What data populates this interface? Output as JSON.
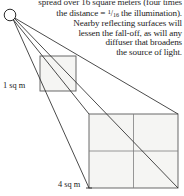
{
  "figure": {
    "kind": "inverse-square-law-diagram",
    "caption_lines": [
      "spread over 16 square meters (four times",
      "the distance = ¹/₁₆ the illumination).",
      "Nearby reflecting surfaces will",
      "lessen the fall-off, as will any",
      "diffuser that  broadens",
      "the source of light."
    ],
    "line_top_clipped": "spread over 16 square meters (four times",
    "line_distance_prefix": "the distance = ",
    "fraction_numerator": "1",
    "fraction_denominator": "16",
    "line_distance_suffix": " the illumination).",
    "line_nearby": "Nearby reflecting surfaces will",
    "line_lessen": "lessen the fall-off, as will any",
    "line_diffuser": "diffuser that  broadens",
    "line_source": "the source of light."
  },
  "labels": {
    "small_square": "1 sq m",
    "large_square": "4 sq m"
  },
  "colors": {
    "ink": "#1a1a1a",
    "ray": "#2b2b2b",
    "square_stroke": "#555555",
    "square_fill": "#f4f4f2",
    "grid_line": "#777777",
    "background": "#ffffff"
  },
  "geometry": {
    "light_source": {
      "cx": 10,
      "cy": 15,
      "r": 6
    },
    "small_square": {
      "x": 40,
      "y": 56,
      "w": 36,
      "h": 35,
      "grid": "none",
      "area_sq_m": 1
    },
    "large_square": {
      "x": 89,
      "y": 114,
      "w": 89,
      "h": 74,
      "grid": "2x2",
      "area_sq_m": 4
    },
    "rays_count": 4
  }
}
